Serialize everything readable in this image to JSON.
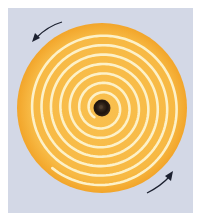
{
  "figure": {
    "colors": {
      "background": "#d3d8e6",
      "disc": "#f7b944",
      "disc_edge": "#f3a92e",
      "groove": "#fdf1c8",
      "center_hole": "#2a1d14",
      "arrow": "#1c2130"
    },
    "arrows": [
      {
        "name": "counterclockwise-arrow-top-left",
        "direction": "counterclockwise"
      },
      {
        "name": "counterclockwise-arrow-bottom-right",
        "direction": "counterclockwise"
      }
    ]
  }
}
